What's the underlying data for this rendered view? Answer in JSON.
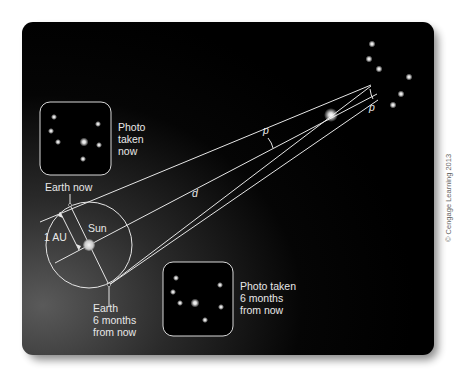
{
  "figure": {
    "labels": {
      "photo_now": [
        "Photo",
        "taken",
        "now"
      ],
      "photo_later": [
        "Photo taken",
        "6 months",
        "from now"
      ],
      "earth_now": "Earth now",
      "earth_later": [
        "Earth",
        "6 months",
        "from now"
      ],
      "sun": "Sun",
      "au": "1 AU",
      "distance": "d",
      "parallax_angle": "p",
      "parallax_angle_far": "p"
    },
    "credit": "© Cengage Learning 2013",
    "colors": {
      "panel_dark": "#000000",
      "panel_light": "#4a4a4a",
      "lines": "#e6e6e6",
      "text": "#e8e8e8",
      "credit": "#666666"
    }
  }
}
